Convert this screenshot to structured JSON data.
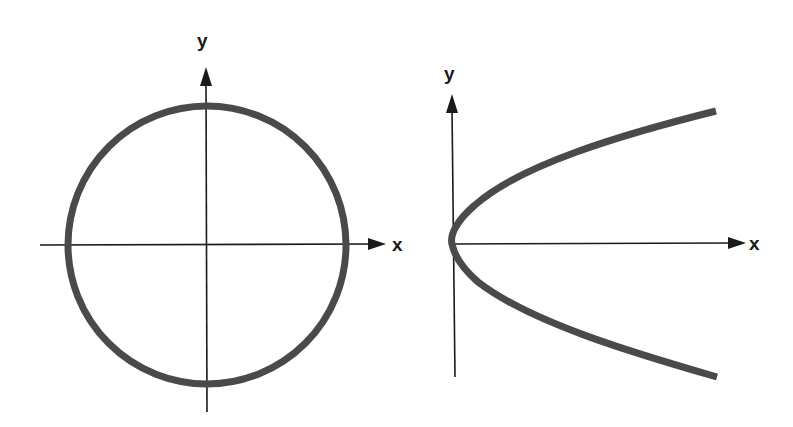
{
  "figure": {
    "panels": [
      {
        "name": "circle",
        "curve_type": "circle",
        "x_axis_label": "x",
        "y_axis_label": "y"
      },
      {
        "name": "parabola",
        "curve_type": "parabola opening right",
        "x_axis_label": "x",
        "y_axis_label": "y"
      }
    ]
  },
  "colors": {
    "curve": "#4a4a4a",
    "axis": "#1a1a1a",
    "background": "#ffffff"
  }
}
